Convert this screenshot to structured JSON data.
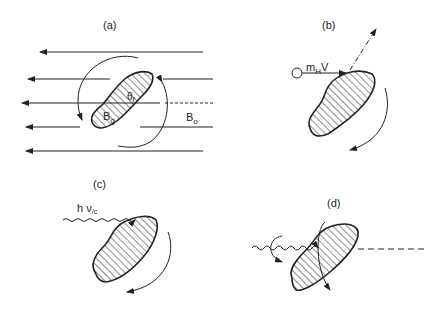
{
  "panels": {
    "a": {
      "label": "(a)",
      "theta": "θ",
      "theta_sub": "f",
      "bg": "B",
      "bg_sub": "g",
      "b0": "B",
      "b0_sub": "o"
    },
    "b": {
      "label": "(b)",
      "mass": "m",
      "mass_sub": "H",
      "vel": "V"
    },
    "c": {
      "label": "(c)",
      "photon": "h ν",
      "photon_sub": "/c"
    },
    "d": {
      "label": "(d)"
    }
  },
  "colors": {
    "ink": "#222222",
    "background": "#ffffff"
  }
}
